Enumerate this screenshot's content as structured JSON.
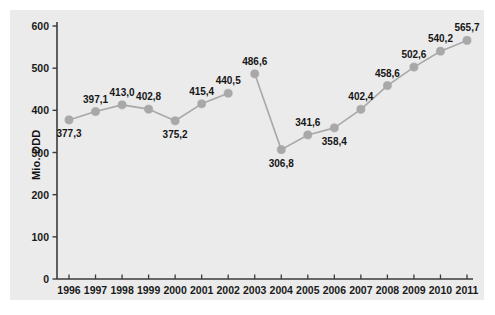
{
  "chart_data": {
    "type": "line",
    "title": "",
    "xlabel": "",
    "ylabel": "Mio. DDD",
    "ylim": [
      0,
      600
    ],
    "yticks": [
      0,
      100,
      200,
      300,
      400,
      500,
      600
    ],
    "ytick_labels": [
      "0",
      "100",
      "200",
      "300",
      "400",
      "500",
      "600"
    ],
    "grid": false,
    "legend": null,
    "categories": [
      "1996",
      "1997",
      "1998",
      "1999",
      "2000",
      "2001",
      "2002",
      "2003",
      "2004",
      "2005",
      "2006",
      "2007",
      "2008",
      "2009",
      "2010",
      "2011"
    ],
    "values": [
      377.3,
      397.1,
      413.0,
      402.8,
      375.2,
      415.4,
      440.5,
      486.6,
      306.8,
      341.6,
      358.4,
      402.4,
      458.6,
      502.6,
      540.2,
      565.7
    ],
    "data_labels": [
      "377,3",
      "397,1",
      "413,0",
      "402,8",
      "375,2",
      "415,4",
      "440,5",
      "486,6",
      "306,8",
      "341,6",
      "358,4",
      "402,4",
      "458,6",
      "502,6",
      "540,2",
      "565,7"
    ],
    "label_positions": [
      "below",
      "above",
      "above",
      "above",
      "below",
      "above",
      "above",
      "above",
      "below",
      "above",
      "below",
      "above",
      "above",
      "above",
      "above",
      "above"
    ],
    "line_breaks": [
      [
        2002,
        2003
      ]
    ],
    "series_color": "#a8a8a8",
    "marker_color": "#a8a8a8",
    "marker_shape": "circle",
    "axis_color": "#3b3b3b",
    "background_color": "#ebebeb",
    "page_color": "#ffffff",
    "text_color": "#161616"
  }
}
